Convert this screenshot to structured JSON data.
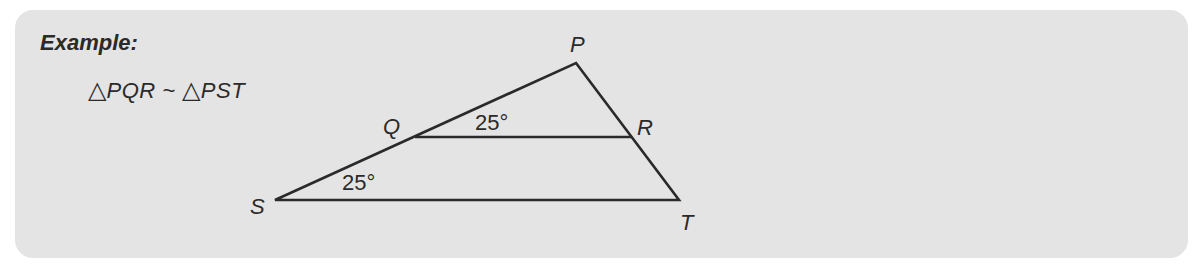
{
  "example": {
    "title": "Example:",
    "statement": {
      "triangle_symbol": "△",
      "triangle1": "PQR",
      "similar_symbol": "~",
      "triangle2": "PST"
    }
  },
  "diagram": {
    "vertices": {
      "P": "P",
      "Q": "Q",
      "R": "R",
      "S": "S",
      "T": "T"
    },
    "angles": {
      "angle_PQR": "25°",
      "angle_PST": "25°"
    }
  },
  "colors": {
    "panel": "#e4e4e4",
    "ink": "#2a2a2a"
  }
}
